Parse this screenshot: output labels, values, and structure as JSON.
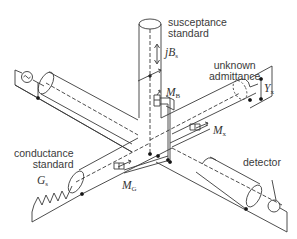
{
  "diagram": {
    "labels": {
      "susceptance_standard": [
        "susceptance",
        "standard"
      ],
      "unknown_admittance": [
        "unknown",
        "admittance"
      ],
      "conductance_standard": [
        "conductance",
        "standard"
      ],
      "detector": "detector"
    },
    "symbols": {
      "jBs": {
        "main": "jB",
        "sub": "s"
      },
      "MB": {
        "main": "M",
        "sub": "B"
      },
      "Yx": {
        "main": "Y",
        "sub": "x"
      },
      "Mx": {
        "main": "M",
        "sub": "x"
      },
      "Gs": {
        "main": "G",
        "sub": "s"
      },
      "MG": {
        "main": "M",
        "sub": "G"
      }
    },
    "components": [
      "ac-source",
      "susceptance-standard-line",
      "unknown-admittance-line",
      "conductance-standard-line",
      "detector-line",
      "coupling-MB",
      "coupling-Mx",
      "coupling-MG"
    ],
    "colors": {
      "line": "#3a3a3a",
      "background": "#ffffff"
    }
  }
}
